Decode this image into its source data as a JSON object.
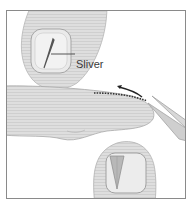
{
  "figure": {
    "label": "Sliver"
  },
  "colors": {
    "skin": "#dcdcdc",
    "skin_line": "#a8a8a8",
    "nail": "#ececec",
    "sliver": "#6a6a6a",
    "frame": "#8a8a8a",
    "text": "#3a3a3a"
  },
  "icons": [
    "fingertip-top",
    "sliver",
    "finger-middle",
    "tweezers",
    "arrow",
    "dotted-path",
    "fingertip-bottom",
    "nail-wedge"
  ]
}
